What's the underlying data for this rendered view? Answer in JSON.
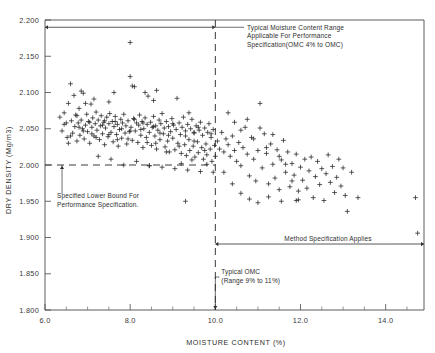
{
  "chart_data": {
    "type": "scatter",
    "title": "",
    "xlabel": "MOISTURE CONTENT (%)",
    "ylabel": "DRY DENSITY (Mg/m3)",
    "xlim": [
      6.0,
      14.9
    ],
    "ylim": [
      1.8,
      2.2
    ],
    "xticks": [
      6.0,
      8.0,
      10.0,
      12.0,
      14.0
    ],
    "xtick_labels": [
      "6.0",
      "8.0",
      "10.0",
      "12.0",
      "14.0"
    ],
    "xtick_minor_step": 0.5,
    "yticks": [
      1.8,
      1.85,
      1.9,
      1.95,
      2.0,
      2.05,
      2.1,
      2.15,
      2.2
    ],
    "ytick_labels": [
      "1.800",
      "1.850",
      "1.900",
      "1.950",
      "2.000",
      "2.050",
      "2.100",
      "2.150",
      "2.200"
    ],
    "grid": false,
    "legend": "none",
    "marker": "plus",
    "marker_color": "#262626",
    "series": [
      {
        "name": "Field compaction test results",
        "points": [
          [
            6.35,
            2.066
          ],
          [
            6.4,
            2.047
          ],
          [
            6.45,
            2.072
          ],
          [
            6.5,
            2.058
          ],
          [
            6.52,
            2.038
          ],
          [
            6.55,
            2.085
          ],
          [
            6.6,
            2.112
          ],
          [
            6.62,
            2.061
          ],
          [
            6.65,
            2.044
          ],
          [
            6.68,
            2.096
          ],
          [
            6.7,
            2.053
          ],
          [
            6.72,
            2.069
          ],
          [
            6.75,
            2.033
          ],
          [
            6.78,
            2.058
          ],
          [
            6.8,
            2.078
          ],
          [
            6.82,
            2.041
          ],
          [
            6.85,
            2.062
          ],
          [
            6.88,
            2.05
          ],
          [
            6.9,
            2.099
          ],
          [
            6.92,
            2.036
          ],
          [
            6.95,
            2.055
          ],
          [
            6.98,
            2.07
          ],
          [
            7.0,
            2.046
          ],
          [
            7.02,
            2.06
          ],
          [
            7.05,
            2.03
          ],
          [
            7.08,
            2.084
          ],
          [
            7.1,
            2.052
          ],
          [
            7.12,
            2.065
          ],
          [
            7.15,
            2.04
          ],
          [
            7.18,
            2.057
          ],
          [
            7.2,
            2.073
          ],
          [
            7.22,
            2.048
          ],
          [
            7.25,
            2.062
          ],
          [
            7.28,
            2.035
          ],
          [
            7.3,
            2.054
          ],
          [
            7.32,
            2.068
          ],
          [
            7.35,
            2.043
          ],
          [
            7.38,
            2.059
          ],
          [
            7.4,
            2.028
          ],
          [
            7.42,
            2.051
          ],
          [
            7.45,
            2.066
          ],
          [
            7.48,
            2.039
          ],
          [
            7.5,
            2.057
          ],
          [
            7.52,
            2.071
          ],
          [
            7.55,
            2.045
          ],
          [
            7.58,
            2.06
          ],
          [
            7.6,
            2.032
          ],
          [
            7.62,
            2.053
          ],
          [
            7.65,
            2.067
          ],
          [
            7.68,
            2.042
          ],
          [
            7.7,
            2.056
          ],
          [
            7.72,
            2.026
          ],
          [
            7.75,
            2.049
          ],
          [
            7.78,
            2.063
          ],
          [
            7.8,
            2.037
          ],
          [
            7.82,
            2.058
          ],
          [
            7.85,
            2.07
          ],
          [
            7.88,
            2.044
          ],
          [
            7.9,
            2.054
          ],
          [
            7.92,
            2.029
          ],
          [
            7.95,
            2.061
          ],
          [
            7.98,
            2.046
          ],
          [
            8.0,
            2.122
          ],
          [
            8.02,
            2.052
          ],
          [
            8.05,
            2.034
          ],
          [
            8.08,
            2.064
          ],
          [
            8.1,
            2.108
          ],
          [
            8.12,
            2.047
          ],
          [
            8.15,
            2.058
          ],
          [
            8.18,
            2.031
          ],
          [
            8.2,
            2.055
          ],
          [
            8.22,
            2.069
          ],
          [
            8.25,
            2.041
          ],
          [
            8.28,
            2.06
          ],
          [
            8.3,
            2.024
          ],
          [
            8.32,
            2.05
          ],
          [
            8.35,
            2.065
          ],
          [
            8.38,
            2.038
          ],
          [
            8.4,
            2.056
          ],
          [
            8.42,
            2.095
          ],
          [
            8.45,
            2.045
          ],
          [
            8.48,
            2.059
          ],
          [
            8.5,
            2.027
          ],
          [
            8.52,
            2.052
          ],
          [
            8.55,
            2.067
          ],
          [
            8.58,
            2.04
          ],
          [
            8.6,
            2.054
          ],
          [
            8.62,
            2.022
          ],
          [
            8.65,
            2.048
          ],
          [
            8.68,
            2.062
          ],
          [
            8.7,
            2.035
          ],
          [
            8.72,
            2.057
          ],
          [
            8.75,
            2.071
          ],
          [
            8.78,
            2.043
          ],
          [
            8.8,
            2.051
          ],
          [
            8.82,
            2.025
          ],
          [
            8.85,
            2.06
          ],
          [
            8.88,
            2.033
          ],
          [
            8.9,
            2.053
          ],
          [
            8.92,
            2.018
          ],
          [
            8.95,
            2.046
          ],
          [
            8.98,
            2.064
          ],
          [
            9.0,
            2.037
          ],
          [
            9.02,
            2.055
          ],
          [
            9.05,
            2.021
          ],
          [
            9.08,
            2.049
          ],
          [
            9.1,
            2.092
          ],
          [
            9.12,
            2.03
          ],
          [
            9.15,
            2.058
          ],
          [
            9.18,
            2.042
          ],
          [
            9.2,
            2.016
          ],
          [
            9.22,
            2.052
          ],
          [
            9.25,
            2.066
          ],
          [
            9.28,
            2.028
          ],
          [
            9.3,
            2.047
          ],
          [
            9.32,
            2.013
          ],
          [
            9.35,
            2.056
          ],
          [
            9.38,
            2.035
          ],
          [
            9.4,
            2.02
          ],
          [
            9.42,
            2.05
          ],
          [
            9.45,
            2.063
          ],
          [
            9.48,
            2.026
          ],
          [
            9.5,
            2.044
          ],
          [
            9.52,
            2.011
          ],
          [
            9.55,
            2.054
          ],
          [
            9.58,
            2.032
          ],
          [
            9.6,
            2.017
          ],
          [
            9.62,
            2.048
          ],
          [
            9.65,
            2.059
          ],
          [
            9.68,
            2.024
          ],
          [
            9.7,
            2.041
          ],
          [
            9.72,
            2.008
          ],
          [
            9.75,
            2.051
          ],
          [
            9.78,
            2.029
          ],
          [
            9.8,
            2.014
          ],
          [
            9.82,
            2.045
          ],
          [
            9.85,
            2.057
          ],
          [
            9.88,
            2.022
          ],
          [
            9.9,
            2.038
          ],
          [
            9.92,
            2.005
          ],
          [
            9.95,
            2.049
          ],
          [
            9.98,
            2.027
          ],
          [
            10.0,
            2.012
          ],
          [
            6.45,
            2.056
          ],
          [
            6.6,
            2.04
          ],
          [
            6.75,
            2.068
          ],
          [
            6.9,
            2.047
          ],
          [
            7.05,
            2.059
          ],
          [
            7.2,
            2.038
          ],
          [
            7.35,
            2.055
          ],
          [
            7.5,
            2.042
          ],
          [
            7.65,
            2.06
          ],
          [
            7.8,
            2.05
          ],
          [
            7.95,
            2.036
          ],
          [
            8.1,
            2.063
          ],
          [
            8.25,
            2.049
          ],
          [
            8.4,
            2.031
          ],
          [
            8.55,
            2.053
          ],
          [
            8.7,
            2.044
          ],
          [
            8.85,
            2.018
          ],
          [
            9.0,
            2.057
          ],
          [
            9.15,
            2.026
          ],
          [
            9.3,
            2.04
          ],
          [
            9.45,
            2.007
          ],
          [
            9.6,
            2.052
          ],
          [
            9.75,
            2.02
          ],
          [
            9.9,
            2.043
          ],
          [
            6.55,
            2.03
          ],
          [
            6.8,
            2.052
          ],
          [
            7.1,
            2.043
          ],
          [
            7.4,
            2.061
          ],
          [
            7.7,
            2.035
          ],
          [
            8.0,
            2.047
          ],
          [
            8.3,
            2.058
          ],
          [
            8.6,
            2.03
          ],
          [
            8.9,
            2.041
          ],
          [
            9.2,
            2.002
          ],
          [
            9.5,
            2.033
          ],
          [
            9.8,
            2.001
          ],
          [
            7.25,
            2.012
          ],
          [
            7.55,
            2.008
          ],
          [
            7.85,
            2.0
          ],
          [
            8.15,
            2.005
          ],
          [
            8.45,
            1.999
          ],
          [
            8.75,
            1.997
          ],
          [
            9.05,
            1.995
          ],
          [
            9.35,
            1.993
          ],
          [
            9.65,
            1.991
          ],
          [
            9.95,
            1.99
          ],
          [
            8.0,
            2.169
          ],
          [
            8.05,
            2.109
          ],
          [
            7.5,
            2.087
          ],
          [
            6.85,
            2.102
          ],
          [
            7.62,
            2.1
          ],
          [
            8.62,
            2.103
          ],
          [
            8.55,
            2.089
          ],
          [
            9.38,
            2.072
          ],
          [
            9.5,
            2.045
          ],
          [
            9.3,
            1.95
          ],
          [
            8.45,
            1.999
          ],
          [
            6.95,
            2.085
          ],
          [
            7.15,
            2.091
          ],
          [
            8.35,
            2.1
          ],
          [
            10.05,
            2.033
          ],
          [
            10.1,
            2.022
          ],
          [
            10.15,
            2.045
          ],
          [
            10.2,
            2.018
          ],
          [
            10.25,
            2.036
          ],
          [
            10.3,
            2.028
          ],
          [
            10.35,
            2.012
          ],
          [
            10.4,
            2.04
          ],
          [
            10.45,
            2.02
          ],
          [
            10.5,
            2.005
          ],
          [
            10.55,
            2.031
          ],
          [
            10.6,
            1.999
          ],
          [
            10.65,
            2.024
          ],
          [
            10.7,
            2.052
          ],
          [
            10.75,
            2.015
          ],
          [
            10.8,
            1.985
          ],
          [
            10.85,
            2.038
          ],
          [
            10.9,
            2.008
          ],
          [
            10.95,
            1.978
          ],
          [
            11.0,
            2.02
          ],
          [
            11.05,
            2.085
          ],
          [
            11.1,
            1.996
          ],
          [
            11.15,
            2.043
          ],
          [
            11.2,
            2.016
          ],
          [
            11.25,
            1.974
          ],
          [
            11.3,
            2.029
          ],
          [
            11.35,
            2.001
          ],
          [
            11.4,
            1.982
          ],
          [
            11.45,
            2.021
          ],
          [
            11.5,
            1.966
          ],
          [
            11.55,
            2.007
          ],
          [
            11.6,
            2.034
          ],
          [
            11.65,
            1.99
          ],
          [
            11.7,
            2.018
          ],
          [
            11.75,
            1.97
          ],
          [
            11.8,
            2.002
          ],
          [
            11.85,
            1.986
          ],
          [
            11.9,
            2.015
          ],
          [
            11.95,
            1.964
          ],
          [
            12.0,
            1.997
          ],
          [
            12.05,
            1.979
          ],
          [
            12.1,
            2.008
          ],
          [
            12.15,
            1.968
          ],
          [
            12.2,
            1.992
          ],
          [
            12.25,
            2.011
          ],
          [
            12.3,
            1.955
          ],
          [
            12.35,
            1.984
          ],
          [
            12.4,
            2.005
          ],
          [
            12.45,
            1.973
          ],
          [
            12.5,
            1.995
          ],
          [
            12.55,
            1.951
          ],
          [
            12.6,
            1.988
          ],
          [
            12.65,
            2.014
          ],
          [
            12.7,
            1.976
          ],
          [
            12.75,
            1.998
          ],
          [
            12.8,
            1.962
          ],
          [
            12.85,
            1.983
          ],
          [
            12.9,
            2.008
          ],
          [
            12.95,
            1.971
          ],
          [
            13.0,
            1.996
          ],
          [
            13.05,
            1.958
          ],
          [
            13.1,
            1.936
          ],
          [
            13.2,
            1.99
          ],
          [
            13.35,
            1.955
          ],
          [
            10.3,
            2.072
          ],
          [
            10.45,
            2.059
          ],
          [
            10.6,
            2.048
          ],
          [
            10.75,
            2.063
          ],
          [
            10.9,
            2.036
          ],
          [
            11.05,
            2.051
          ],
          [
            11.2,
            2.024
          ],
          [
            11.35,
            2.042
          ],
          [
            11.5,
            2.012
          ],
          [
            11.65,
            2.001
          ],
          [
            11.8,
            1.978
          ],
          [
            11.95,
            1.952
          ],
          [
            10.2,
            1.99
          ],
          [
            10.4,
            1.974
          ],
          [
            10.6,
            1.961
          ],
          [
            10.8,
            1.953
          ],
          [
            11.0,
            1.948
          ],
          [
            11.25,
            1.956
          ],
          [
            11.55,
            1.95
          ],
          [
            11.9,
            1.951
          ],
          [
            14.7,
            1.955
          ],
          [
            14.75,
            1.906
          ]
        ]
      }
    ],
    "reference_lines": [
      {
        "name": "specified-lower-bound",
        "orientation": "horizontal",
        "value": 2.0,
        "x_from": 6.0,
        "x_to": 10.0,
        "style": "dashed"
      },
      {
        "name": "typical-omc",
        "orientation": "vertical",
        "value": 10.0,
        "y_from": 1.8,
        "y_to": 2.2,
        "style": "dashed"
      }
    ],
    "annotations": [
      {
        "name": "performance-spec-range",
        "lines": [
          "Typical Moisture Content Range",
          "Applicable For Performance",
          "Specification(OMC  4% to OMC)"
        ],
        "arrow": "double",
        "arrow_y": 2.19,
        "arrow_x_from": 6.0,
        "arrow_x_to": 10.0
      },
      {
        "name": "specified-lower-bound",
        "lines": [
          "Specified Lower Bound For",
          "Performance Specification."
        ],
        "arrow": "up",
        "arrow_x": 6.4,
        "arrow_y": 2.0
      },
      {
        "name": "method-spec-applies",
        "lines": [
          "Method  Specification  Applies"
        ],
        "arrow": "double",
        "arrow_y": 1.891,
        "arrow_x_from": 10.0,
        "arrow_x_to": 14.9
      },
      {
        "name": "typical-omc",
        "lines": [
          "Typical  OMC",
          "(Range 9% to 11%)"
        ],
        "arrow": "down",
        "arrow_x": 10.0,
        "arrow_y": 1.8
      }
    ]
  }
}
